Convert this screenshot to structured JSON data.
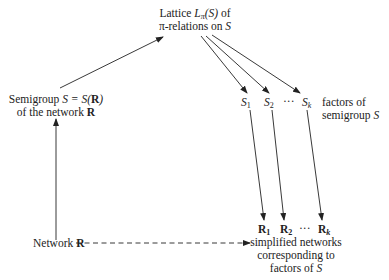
{
  "diagram": {
    "type": "flow",
    "nodes": {
      "lattice": {
        "line1_prefix": "Lattice ",
        "line1_symbol": "L",
        "line1_sub": "π",
        "line1_arg": "(S)",
        "line1_suffix": " of",
        "line2_prefix": "π-relations on ",
        "line2_symbol": "S"
      },
      "semigroup": {
        "line1_prefix": "Semigroup ",
        "line1_eq": "S = S(",
        "line1_bold": "R",
        "line1_close": ")",
        "line2_prefix": "of the network ",
        "line2_bold": "R"
      },
      "factors": {
        "items": [
          {
            "symbol": "S",
            "sub": "1"
          },
          {
            "symbol": "S",
            "sub": "2"
          },
          {
            "symbol": "···",
            "sub": ""
          },
          {
            "symbol": "S",
            "sub": "k"
          }
        ],
        "caption_line1": "factors of",
        "caption_line2": "semigroup ",
        "caption_symbol": "S"
      },
      "network": {
        "prefix": "Network ",
        "bold": "R"
      },
      "simplified": {
        "items": [
          {
            "symbol": "R",
            "sub": "1"
          },
          {
            "symbol": "R",
            "sub": "2"
          },
          {
            "symbol": "···",
            "sub": ""
          },
          {
            "symbol": "R",
            "sub": "k"
          }
        ],
        "caption_line1": "simplified networks",
        "caption_line2": "corresponding to",
        "caption_line3_prefix": "factors of ",
        "caption_line3_symbol": "S"
      }
    },
    "edges": [
      {
        "from": "network",
        "to": "semigroup",
        "style": "solid"
      },
      {
        "from": "semigroup",
        "to": "lattice",
        "style": "solid"
      },
      {
        "from": "lattice",
        "to": "S1",
        "style": "solid"
      },
      {
        "from": "lattice",
        "to": "S2",
        "style": "solid"
      },
      {
        "from": "lattice",
        "to": "Sk",
        "style": "solid"
      },
      {
        "from": "S1",
        "to": "R1",
        "style": "solid"
      },
      {
        "from": "S2",
        "to": "R2",
        "style": "solid"
      },
      {
        "from": "Sk",
        "to": "Rk",
        "style": "solid"
      },
      {
        "from": "network",
        "to": "simplified",
        "style": "dashed"
      }
    ],
    "colors": {
      "ink": "#222222",
      "background": "#ffffff"
    }
  }
}
